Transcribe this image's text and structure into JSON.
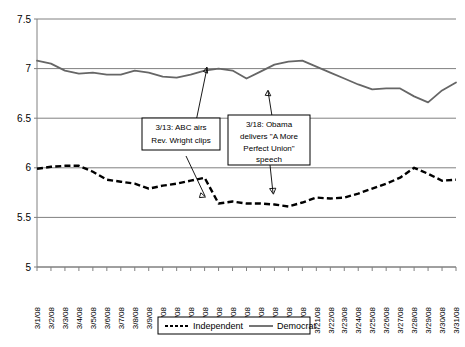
{
  "chart_data": {
    "type": "line",
    "title": "",
    "xlabel": "",
    "ylabel": "",
    "ylim": [
      5,
      7.5
    ],
    "yticks": [
      "5",
      "5.5",
      "6",
      "6.5",
      "7",
      "7.5"
    ],
    "grid": true,
    "legend_position": "bottom",
    "categories": [
      "3/1/08",
      "3/2/08",
      "3/3/08",
      "3/4/08",
      "3/5/08",
      "3/6/08",
      "3/7/08",
      "3/8/08",
      "3/9/08",
      "3/10/08",
      "3/11/08",
      "3/12/08",
      "3/13/08",
      "3/14/08",
      "3/15/08",
      "3/16/08",
      "3/17/08",
      "3/18/08",
      "3/19/08",
      "3/20/08",
      "3/21/08",
      "3/22/08",
      "3/23/08",
      "3/24/08",
      "3/25/08",
      "3/26/08",
      "3/27/08",
      "3/28/08",
      "3/29/08",
      "3/30/08",
      "3/31/08"
    ],
    "series": [
      {
        "name": "Independent",
        "style": "dashed",
        "color": "#000000",
        "values": [
          5.99,
          6.01,
          6.02,
          6.02,
          5.96,
          5.88,
          5.86,
          5.84,
          5.79,
          5.82,
          5.84,
          5.87,
          5.9,
          5.64,
          5.66,
          5.64,
          5.64,
          5.63,
          5.61,
          5.65,
          5.7,
          5.69,
          5.7,
          5.74,
          5.79,
          5.84,
          5.9,
          6.0,
          5.94,
          5.87,
          5.88
        ]
      },
      {
        "name": "Democrat",
        "style": "solid",
        "color": "#666666",
        "values": [
          7.08,
          7.05,
          6.98,
          6.95,
          6.96,
          6.94,
          6.94,
          6.98,
          6.96,
          6.92,
          6.91,
          6.94,
          6.98,
          7.0,
          6.98,
          6.9,
          6.97,
          7.04,
          7.07,
          7.08,
          7.02,
          6.96,
          6.9,
          6.84,
          6.79,
          6.8,
          6.8,
          6.72,
          6.66,
          6.78,
          6.86
        ]
      }
    ],
    "annotations": [
      {
        "id": "annotation-wright",
        "text": "3/13: ABC  airs Rev. Wright clips",
        "lines": [
          "3/13: ABC  airs",
          "Rev. Wright clips"
        ],
        "target_date": "3/13/08"
      },
      {
        "id": "annotation-speech",
        "text": "3/18: Obama delivers \"A More Perfect Union\" speech",
        "lines": [
          "3/18: Obama",
          "delivers \"A More",
          "Perfect Union\"",
          "speech"
        ],
        "target_date": "3/18/08"
      }
    ],
    "legend": [
      {
        "label": "Independent",
        "style": "dashed"
      },
      {
        "label": "Democrat",
        "style": "solid"
      }
    ]
  }
}
